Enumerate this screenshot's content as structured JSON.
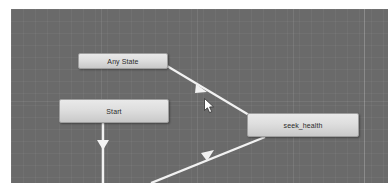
{
  "app": {
    "name": "Unity Animator",
    "window_title": "Animator",
    "view": "state-machine-graph"
  },
  "canvas": {
    "background_color": "#6a6a6a",
    "grid_color": "#7a7a7a",
    "grid_visible": true,
    "panel_divider_visible": true
  },
  "graph": {
    "nodes": [
      {
        "id": "any-state",
        "label": "Any State",
        "x": 67,
        "y": 44,
        "width": 90,
        "height": 16,
        "fill": "#dedede",
        "text_color": "#2b2b2b",
        "selected": false
      },
      {
        "id": "start",
        "label": "Start",
        "x": 48,
        "y": 90,
        "width": 110,
        "height": 24,
        "fill": "#dedede",
        "text_color": "#2b2b2b",
        "selected": false
      },
      {
        "id": "seek-health",
        "label": "seek_health",
        "x": 236,
        "y": 104,
        "width": 112,
        "height": 24,
        "fill": "#dedede",
        "text_color": "#2b2b2b",
        "selected": false
      }
    ],
    "transitions": [
      {
        "id": "any-state-to-seek-health",
        "from": "any-state",
        "to": "seek-health",
        "color": "#f2f2f2",
        "arrow_direction": "right-down"
      },
      {
        "id": "start-to-down",
        "from": "start",
        "to": "offscreen-below",
        "color": "#f2f2f2",
        "arrow_direction": "down"
      },
      {
        "id": "seek-health-to-lower-left",
        "from": "seek-health",
        "to": "offscreen-lower-left",
        "color": "#f2f2f2",
        "arrow_direction": "down-left"
      }
    ]
  },
  "pointer": {
    "type": "arrow-cursor",
    "x": 193,
    "y": 89
  }
}
